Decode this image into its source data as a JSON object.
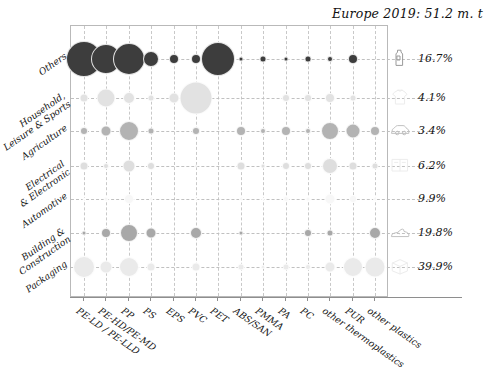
{
  "chart_data": {
    "type": "scatter",
    "title": "Europe 2019: 51.2 m. t",
    "xlabel": "",
    "ylabel": "",
    "grid": true,
    "legend_position": "right",
    "categories": [
      "PE-LD / PE-LLD",
      "PE-HD/PE-MD",
      "PP",
      "PS",
      "EPS",
      "PVC",
      "PET",
      "ABS/SAN",
      "PMMA",
      "PA",
      "PC",
      "other thermoplastics",
      "PUR",
      "other plastics"
    ],
    "rows": [
      "Others",
      "Household, Leisure & Sports",
      "Agriculture",
      "Electrical & Electronic",
      "Automotive",
      "Building & Construction",
      "Packaging"
    ],
    "series": [
      {
        "name": "Others",
        "share": "16.7%",
        "icon": "bottle-icon",
        "color": "#3d3d3d",
        "values": [
          18.0,
          15.0,
          16.0,
          8.0,
          5.0,
          5.0,
          17.0,
          2.5,
          3.5,
          2.5,
          3.5,
          3.0,
          5.0,
          0.0
        ]
      },
      {
        "name": "Household, Leisure & Sports",
        "share": "4.1%",
        "icon": "tshirt-icon",
        "color": "#e2e2e2",
        "values": [
          4.5,
          9.5,
          6.0,
          3.5,
          5.5,
          16.5,
          0.0,
          0.0,
          0.0,
          4.0,
          4.0,
          5.0,
          3.5,
          0.0
        ]
      },
      {
        "name": "Agriculture",
        "share": "3.4%",
        "icon": "car-icon",
        "color": "#b3b3b3",
        "values": [
          4.0,
          5.5,
          10.0,
          3.5,
          0.0,
          4.0,
          0.0,
          5.0,
          3.0,
          5.0,
          3.0,
          9.0,
          7.5,
          5.0
        ]
      },
      {
        "name": "Electrical & Electronic",
        "share": "6.2%",
        "icon": "appliance-icon",
        "color": "#dedede",
        "values": [
          4.5,
          3.0,
          6.5,
          4.0,
          0.0,
          1.5,
          0.0,
          4.5,
          2.5,
          4.0,
          4.0,
          8.0,
          4.5,
          3.5
        ]
      },
      {
        "name": "Automotive",
        "share": "9.9%",
        "icon": "none",
        "color": "#f7f7f7",
        "values": [
          1.5,
          2.5,
          5.0,
          2.0,
          0.0,
          1.5,
          0.0,
          2.0,
          1.5,
          3.0,
          2.5,
          5.5,
          4.0,
          2.0
        ]
      },
      {
        "name": "Building & Construction",
        "share": "19.8%",
        "icon": "shoe-icon",
        "color": "#a8a8a8",
        "values": [
          2.5,
          5.0,
          9.0,
          5.5,
          0.0,
          6.0,
          0.0,
          2.5,
          0.0,
          0.0,
          4.0,
          3.5,
          0.0,
          6.0
        ]
      },
      {
        "name": "Packaging",
        "share": "39.9%",
        "icon": "package-icon",
        "color": "#eaeaea",
        "values": [
          11.0,
          6.5,
          10.0,
          4.5,
          0.0,
          4.5,
          0.0,
          3.5,
          2.0,
          3.5,
          3.0,
          5.5,
          10.0,
          10.5
        ]
      }
    ]
  },
  "axes": {
    "x_origin": 83,
    "x_step": 22.4,
    "row_y": [
      58,
      97,
      130,
      165,
      198,
      232,
      266
    ]
  },
  "legend": {
    "shares": [
      "16.7%",
      "4.1%",
      "3.4%",
      "6.2%",
      "9.9%",
      "19.8%",
      "39.9%"
    ],
    "icons": [
      "bottle-icon",
      "tshirt-icon",
      "car-icon",
      "appliance-icon",
      "none",
      "shoe-icon",
      "package-icon"
    ]
  },
  "y_label_lines": [
    [
      "Others"
    ],
    [
      "Household,",
      "Leisure & Sports"
    ],
    [
      "Agriculture"
    ],
    [
      "Electrical",
      "& Electronic"
    ],
    [
      "Automotive"
    ],
    [
      "Building &",
      "Construction"
    ],
    [
      "Packaging"
    ]
  ]
}
